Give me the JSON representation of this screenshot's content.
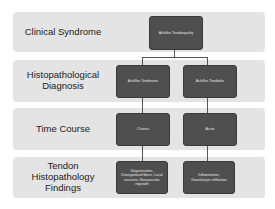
{
  "rows": [
    {
      "label": "Clinical Syndrome"
    },
    {
      "label": "Histopathological Diagnosis"
    },
    {
      "label": "Time Course"
    },
    {
      "label": "Tendon Histopathology Findings"
    }
  ],
  "nodes": {
    "root": "Achilles Tendinopathy",
    "diag_left": "Achilles Tendinosis",
    "diag_right": "Achilles Tendinitis",
    "time_left": "Chronic",
    "time_right": "Acute",
    "find_left": "Degeneration, Disorganized fibers, Local necrosis, Neovascular ingrowth",
    "find_right": "Inflammation, Granulocyte infiltration"
  }
}
